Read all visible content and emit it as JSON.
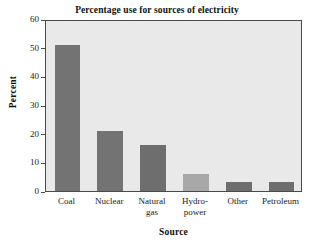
{
  "chart_data": {
    "type": "bar",
    "title": "Percentage use for sources of electricity",
    "xlabel": "Source",
    "ylabel": "Percent",
    "categories": [
      "Coal",
      "Nuclear",
      "Natural gas",
      "Hydro-power",
      "Other",
      "Petroleum"
    ],
    "category_lines": [
      [
        "Coal"
      ],
      [
        "Nuclear"
      ],
      [
        "Natural",
        "gas"
      ],
      [
        "Hydro-",
        "power"
      ],
      [
        "Other"
      ],
      [
        "Petroleum"
      ]
    ],
    "values": [
      51,
      21,
      16,
      6,
      3,
      3
    ],
    "ylim": [
      0,
      60
    ],
    "yticks": [
      0,
      10,
      20,
      30,
      40,
      50,
      60
    ],
    "ytick_labels": [
      "0",
      "10",
      "20",
      "30",
      "40",
      "50",
      "60"
    ],
    "grid": false,
    "legend": false,
    "bar_colors": [
      "#737373",
      "#737373",
      "#6e6e6e",
      "#a8a8a8",
      "#6e6e6e",
      "#6e6e6e"
    ],
    "plot_background": "#e9e9e9",
    "frame_color": "#4a4a4a",
    "figure_background": "#ffffff"
  }
}
